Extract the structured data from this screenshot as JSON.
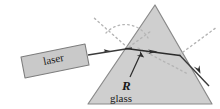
{
  "figure": {
    "width": 220,
    "height": 109,
    "background_color": "#ffffff"
  },
  "labels": {
    "laser": "laser",
    "glass": "glass",
    "refracted_ray": "R"
  },
  "colors": {
    "prism_fill": "#cfcfcf",
    "prism_stroke": "#8a8a8a",
    "laser_box_fill": "#c8c8c8",
    "laser_box_stroke": "#7a7a7a",
    "ray_stroke": "#3a3a3a",
    "dotted_stroke": "#b0b0b0",
    "text_color": "#1a1a1a"
  },
  "geometry": {
    "prism": {
      "apex": [
        155,
        5
      ],
      "bottom_left": [
        88,
        104
      ],
      "bottom_right": [
        212,
        104
      ]
    },
    "laser_box": {
      "corners": [
        [
          21,
          56
        ],
        [
          84,
          44
        ],
        [
          88,
          66
        ],
        [
          25,
          78
        ]
      ]
    },
    "incident_ray": {
      "from": [
        88,
        54
      ],
      "to": [
        137,
        47
      ]
    },
    "internal_ray": {
      "from": [
        124,
        49
      ],
      "to": [
        178,
        55
      ]
    },
    "exit_ray": {
      "from": [
        178,
        55
      ],
      "to": [
        208,
        84
      ]
    },
    "normal_dotted_entry": {
      "from": [
        127,
        48
      ],
      "to": [
        92,
        18
      ]
    },
    "surface_dotted_extension": {
      "from": [
        127,
        48
      ],
      "to": [
        152,
        30
      ]
    },
    "exit_dotted_extension": {
      "from": [
        178,
        55
      ],
      "to": [
        216,
        28
      ]
    },
    "internal_dotted_extension": {
      "from": [
        137,
        47
      ],
      "to": [
        186,
        73
      ]
    },
    "angle_arc_center": [
      127,
      48
    ],
    "angle_arc_radius": 22
  },
  "annotations": {
    "arrow_incident": "arrowhead-on-incident-ray",
    "arrow_internal": "arrowhead-on-internal-ray",
    "arrow_exit": "arrowhead-on-exit-ray",
    "arrow_r_pointer": "arrow-pointing-to-refraction-point"
  }
}
